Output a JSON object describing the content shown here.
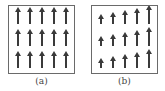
{
  "figure": {
    "panels": [
      {
        "id": "a",
        "caption": "(a)",
        "description": "uniform field: all arrows equal length pointing up",
        "rows": 3,
        "cols": 5,
        "arrow_lengths": [
          [
            17,
            17,
            17,
            17,
            17
          ],
          [
            17,
            17,
            17,
            17,
            17
          ],
          [
            17,
            17,
            17,
            17,
            17
          ]
        ],
        "arrow_direction": "up"
      },
      {
        "id": "b",
        "caption": "(b)",
        "description": "non-uniform field: arrows point up, increasing in length left to right",
        "rows": 3,
        "cols": 5,
        "arrow_lengths": [
          [
            10,
            12,
            14,
            16,
            19
          ],
          [
            10,
            12,
            14,
            16,
            19
          ],
          [
            10,
            12,
            14,
            16,
            19
          ]
        ],
        "arrow_direction": "up"
      }
    ],
    "colors": {
      "arrow": "#3a3a3a",
      "border": "#6a6a6a",
      "caption": "#444444"
    }
  }
}
